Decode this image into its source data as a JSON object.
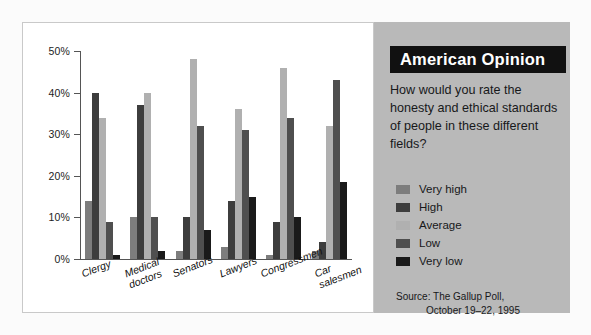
{
  "panel": {
    "banner_title": "American Opinion",
    "question": "How would you rate the honesty and ethical standards of people in these different fields?",
    "source_line1": "Source: The Gallup Poll,",
    "source_line2": "October 19–22, 1995"
  },
  "colors": {
    "very_high": "#7d7d7d",
    "high": "#3d3d3d",
    "average": "#b0b0b0",
    "low": "#4f4f4f",
    "very_low": "#1a1a1a",
    "panel_background": "#b9b9b9",
    "banner_background": "#111111",
    "plot_background": "#ffffff"
  },
  "chart_data": {
    "type": "bar",
    "title": "American Opinion",
    "xlabel": "",
    "ylabel": "",
    "ylim": [
      0,
      50
    ],
    "ytick_labels": [
      "0%",
      "10%",
      "20%",
      "30%",
      "40%",
      "50%"
    ],
    "ytick_values": [
      0,
      10,
      20,
      30,
      40,
      50
    ],
    "grid": false,
    "legend_position": "right",
    "categories": [
      "Clergy",
      "Medical\ndoctors",
      "Senators",
      "Lawyers",
      "Congressmen",
      "Car\nsalesmen"
    ],
    "series": [
      {
        "name": "Very high",
        "values": [
          14,
          10,
          2,
          3,
          1,
          2
        ]
      },
      {
        "name": "High",
        "values": [
          40,
          37,
          10,
          14,
          9,
          4
        ]
      },
      {
        "name": "Average",
        "values": [
          34,
          40,
          48,
          36,
          46,
          32
        ]
      },
      {
        "name": "Low",
        "values": [
          9,
          10,
          32,
          31,
          34,
          43
        ]
      },
      {
        "name": "Very low",
        "values": [
          1,
          2,
          7,
          15,
          10,
          18.5
        ]
      }
    ]
  }
}
